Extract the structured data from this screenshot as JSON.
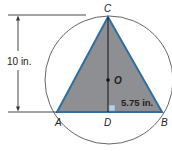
{
  "diagram": {
    "type": "inscribed-triangle-in-circle",
    "colors": {
      "triangle_fill": "#8e8f92",
      "triangle_edge": "#2f6fa0",
      "circle_stroke": "#555555",
      "dimension_line": "#333333",
      "right_angle_marker": "#b8d0e6"
    },
    "points": {
      "C": {
        "label": "C"
      },
      "A": {
        "label": "A"
      },
      "B": {
        "label": "B"
      },
      "D": {
        "label": "D"
      },
      "O": {
        "label": "O"
      }
    },
    "measurements": {
      "height": "10 in.",
      "half_base": "5.75 in."
    }
  }
}
